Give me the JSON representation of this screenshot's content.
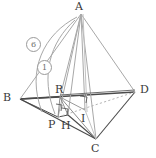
{
  "figure": {
    "kind": "solid-geometry-diagram",
    "colors": {
      "background": "#ffffff",
      "edge_dark": "#4a4a4a",
      "edge_light": "#a8a8a8",
      "edge_faint": "#c2c2c2",
      "dashed": "#b5b5b5",
      "label": "#3a3a3a",
      "annotation": "#6e6e6e"
    }
  },
  "vertices": [
    {
      "id": "A",
      "label": "A",
      "x": 81,
      "y": 14,
      "lx": 75,
      "ly": 3
    },
    {
      "id": "B",
      "label": "B",
      "x": 20,
      "y": 99,
      "lx": 3,
      "ly": 94
    },
    {
      "id": "C",
      "label": "C",
      "x": 96,
      "y": 139,
      "lx": 91,
      "ly": 143
    },
    {
      "id": "D",
      "label": "D",
      "x": 135,
      "y": 92,
      "lx": 140,
      "ly": 85
    },
    {
      "id": "R",
      "label": "R",
      "x": 60,
      "y": 97,
      "lx": 55,
      "ly": 85
    },
    {
      "id": "P",
      "label": "P",
      "x": 58,
      "y": 117,
      "lx": 50,
      "ly": 119
    },
    {
      "id": "H",
      "label": "H",
      "x": 68,
      "y": 115,
      "lx": 63,
      "ly": 120
    },
    {
      "id": "I",
      "label": "I",
      "x": 85,
      "y": 110,
      "lx": 81,
      "ly": 114
    }
  ],
  "annotations": [
    {
      "id": "arc-6",
      "label": "6",
      "x": 32,
      "y": 43
    },
    {
      "id": "arc-1",
      "label": "1",
      "x": 43,
      "y": 66
    }
  ],
  "right_angle_marks": [
    {
      "id": "mark-at-P",
      "x": 60,
      "y": 107
    },
    {
      "id": "mark-at-H",
      "x": 63,
      "y": 112
    },
    {
      "id": "mark-at-I",
      "x": 84,
      "y": 99
    }
  ]
}
